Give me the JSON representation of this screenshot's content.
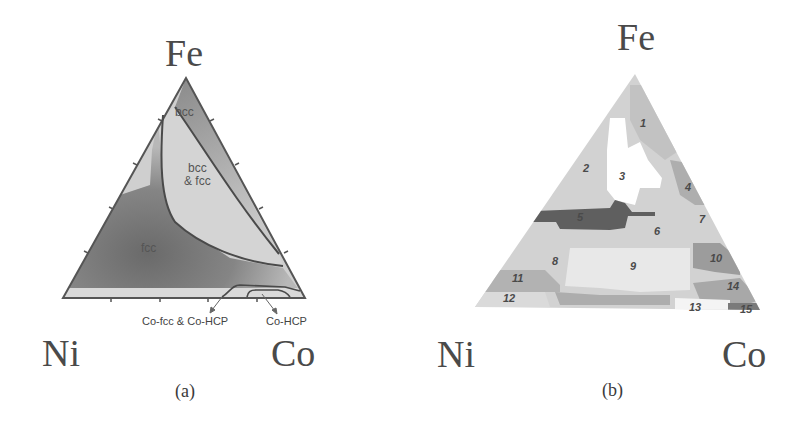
{
  "panel_a": {
    "caption": "(a)",
    "vertices": {
      "top": "Fe",
      "left": "Ni",
      "right": "Co"
    },
    "phases": {
      "bcc": "bcc",
      "bcc_fcc_line1": "bcc",
      "bcc_fcc_line2": "& fcc",
      "fcc": "fcc"
    },
    "annotations": {
      "co_fcc_hcp": "Co-fcc & Co-HCP",
      "co_hcp": "Co-HCP"
    }
  },
  "panel_b": {
    "caption": "(b)",
    "vertices": {
      "top": "Fe",
      "left": "Ni",
      "right": "Co"
    },
    "regions": [
      "1",
      "2",
      "3",
      "4",
      "5",
      "6",
      "7",
      "8",
      "9",
      "10",
      "11",
      "12",
      "13",
      "14",
      "15"
    ]
  },
  "colors": {
    "fcc_dark": "#6e6e6e",
    "bcc_mid": "#9a9a9a",
    "light": "#d6d6d6",
    "outline": "#555555",
    "region5": "#5f5f5f"
  }
}
